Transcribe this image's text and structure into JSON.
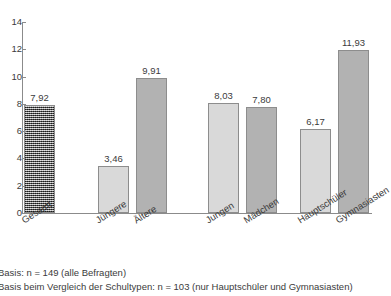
{
  "title_remnant": "",
  "chart_data": {
    "type": "bar",
    "title": "",
    "xlabel": "",
    "ylabel": "",
    "ylim": [
      0,
      14
    ],
    "yticks": [
      "0",
      "2",
      "4",
      "6",
      "8",
      "10",
      "12",
      "14"
    ],
    "grid": false,
    "legend": "none",
    "categories": [
      "Gesamt",
      "Jüngere",
      "Ältere",
      "Jungen",
      "Mädchen",
      "Hauptschüler",
      "Gymnasiasten"
    ],
    "values": [
      7.92,
      3.46,
      9.91,
      8.03,
      7.8,
      6.17,
      11.93
    ],
    "value_labels": [
      "7,92",
      "3,46",
      "9,91",
      "8,03",
      "7,80",
      "6,17",
      "11,93"
    ],
    "bar_styles": [
      "hatch",
      "light",
      "dark",
      "light",
      "dark",
      "light",
      "dark"
    ]
  },
  "footnotes": [
    "Basis: n = 149 (alle Befragten)",
    "Basis beim Vergleich der Schultypen: n = 103 (nur Hauptschüler und Gymnasiasten)"
  ]
}
